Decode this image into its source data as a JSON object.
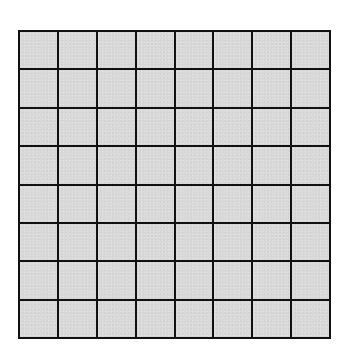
{
  "grid": {
    "rows": 8,
    "columns": 8,
    "cell_color": "#d9d9d9",
    "line_color": "#111111",
    "background_color": "#ffffff"
  }
}
